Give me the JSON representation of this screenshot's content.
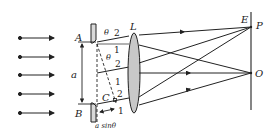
{
  "diagram": {
    "labels": {
      "A": "A",
      "B": "B",
      "C": "C",
      "a": "a",
      "L": "L",
      "E": "E",
      "P": "P",
      "O": "O",
      "theta1": "θ",
      "theta2": "θ",
      "path_diff": "a sinθ"
    },
    "ray_numbers": {
      "top_2": "2",
      "top_1": "1",
      "mid_2": "2",
      "mid_1": "1",
      "bot_2": "2",
      "bot_1": "1"
    },
    "colors": {
      "line": "#222222",
      "lens_fill": "#c8c8c8",
      "slit_fill": "#d9d9d9"
    }
  }
}
